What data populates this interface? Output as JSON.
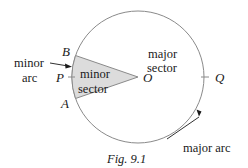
{
  "figure": {
    "caption": "Fig. 9.1",
    "colors": {
      "circle": "#8a8a8a",
      "sector_fill": "#dcdcdc",
      "sector_stroke": "#8a8a8a",
      "text": "#1a1a1a"
    },
    "points": {
      "A": "A",
      "B": "B",
      "P": "P",
      "O": "O",
      "Q": "Q"
    },
    "labels": {
      "minor_arc_line1": "minor",
      "minor_arc_line2": "arc",
      "minor_sector_line1": "minor",
      "minor_sector_line2": "sector",
      "major_sector_line1": "major",
      "major_sector_line2": "sector",
      "major_arc": "major arc"
    }
  }
}
